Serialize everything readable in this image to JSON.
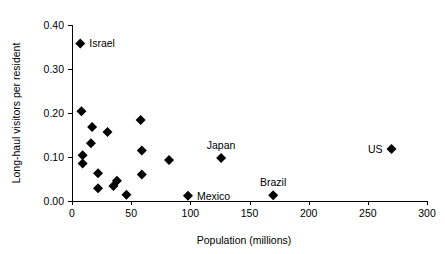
{
  "chart_data": {
    "type": "scatter",
    "title": "",
    "xlabel": "Population (millions)",
    "ylabel": "Long-haul visitors per resident",
    "xlim": [
      0,
      300
    ],
    "ylim": [
      0.0,
      0.4
    ],
    "grid": false,
    "legend": "none",
    "xticks": [
      0,
      50,
      100,
      150,
      200,
      250,
      300
    ],
    "xtick_labels": [
      "0",
      "50",
      "100",
      "150",
      "200",
      "250",
      "300"
    ],
    "yticks": [
      0.0,
      0.1,
      0.2,
      0.3,
      0.4
    ],
    "ytick_labels": [
      "0.00",
      "0.10",
      "0.20",
      "0.30",
      "0.40"
    ],
    "marker": "diamond",
    "marker_color": "#000000",
    "points": [
      {
        "label": "Israel",
        "x": 7,
        "y": 0.358,
        "label_pos": "right"
      },
      {
        "label": "",
        "x": 8,
        "y": 0.204,
        "label_pos": "none"
      },
      {
        "label": "",
        "x": 9,
        "y": 0.104,
        "label_pos": "none"
      },
      {
        "label": "",
        "x": 9,
        "y": 0.085,
        "label_pos": "none"
      },
      {
        "label": "",
        "x": 17,
        "y": 0.168,
        "label_pos": "none"
      },
      {
        "label": "",
        "x": 16,
        "y": 0.131,
        "label_pos": "none"
      },
      {
        "label": "",
        "x": 22,
        "y": 0.063,
        "label_pos": "none"
      },
      {
        "label": "",
        "x": 22,
        "y": 0.029,
        "label_pos": "none"
      },
      {
        "label": "",
        "x": 30,
        "y": 0.157,
        "label_pos": "none"
      },
      {
        "label": "",
        "x": 35,
        "y": 0.034,
        "label_pos": "none"
      },
      {
        "label": "",
        "x": 38,
        "y": 0.046,
        "label_pos": "none"
      },
      {
        "label": "",
        "x": 46,
        "y": 0.014,
        "label_pos": "none"
      },
      {
        "label": "",
        "x": 58,
        "y": 0.184,
        "label_pos": "none"
      },
      {
        "label": "",
        "x": 59,
        "y": 0.115,
        "label_pos": "none"
      },
      {
        "label": "",
        "x": 59,
        "y": 0.06,
        "label_pos": "none"
      },
      {
        "label": "",
        "x": 82,
        "y": 0.093,
        "label_pos": "none"
      },
      {
        "label": "Mexico",
        "x": 98,
        "y": 0.012,
        "label_pos": "right"
      },
      {
        "label": "Japan",
        "x": 126,
        "y": 0.098,
        "label_pos": "above"
      },
      {
        "label": "Brazil",
        "x": 170,
        "y": 0.013,
        "label_pos": "above"
      },
      {
        "label": "US",
        "x": 270,
        "y": 0.118,
        "label_pos": "left"
      }
    ],
    "annotations": [
      "Israel",
      "Japan",
      "Mexico",
      "Brazil",
      "US"
    ]
  }
}
